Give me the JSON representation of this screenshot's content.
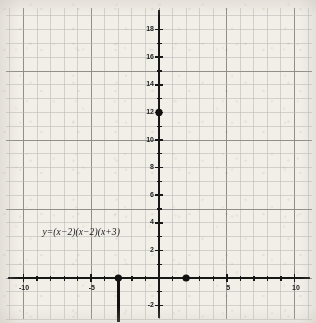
{
  "chart_data": {
    "type": "scatter",
    "title": "",
    "xlabel": "",
    "ylabel": "",
    "xlim": [
      -11.5,
      11.5
    ],
    "ylim": [
      -3.2,
      19.5
    ],
    "grid": true,
    "grid_minor_step": 1,
    "grid_major_step": 5,
    "legend": "none",
    "equation_label": "y=(x−2)(x−2)(x+3)",
    "equation_position": {
      "x": -8.6,
      "y": 3.2
    },
    "x_tick_labels": [
      {
        "value": -10,
        "text": "-10"
      },
      {
        "value": -5,
        "text": "-5"
      },
      {
        "value": 5,
        "text": "5"
      },
      {
        "value": 10,
        "text": "10"
      }
    ],
    "y_tick_labels": [
      {
        "value": 18,
        "text": "18"
      },
      {
        "value": 16,
        "text": "16"
      },
      {
        "value": 14,
        "text": "14"
      },
      {
        "value": 12,
        "text": "12"
      },
      {
        "value": 10,
        "text": "10"
      },
      {
        "value": 8,
        "text": "8"
      },
      {
        "value": 6,
        "text": "6"
      },
      {
        "value": 4,
        "text": "4"
      },
      {
        "value": 2,
        "text": "2"
      },
      {
        "value": -2,
        "text": "-2"
      }
    ],
    "x_minor_ticks": [
      -9,
      -8,
      -7,
      -6,
      -4,
      -3,
      -2,
      -1,
      1,
      2,
      3,
      4,
      6,
      7,
      8,
      9
    ],
    "y_minor_ticks": [
      1,
      3,
      5,
      7,
      9,
      11,
      13,
      15,
      17,
      -1
    ],
    "points": [
      {
        "x": 0,
        "y": 12,
        "label": "y-intercept"
      },
      {
        "x": -3,
        "y": 0,
        "label": "root-x-minus-3"
      },
      {
        "x": 2,
        "y": 0,
        "label": "root-x-2"
      }
    ],
    "segments": [
      {
        "x1": -3,
        "y1": 0,
        "x2": -3,
        "y2": -3.2,
        "label": "vertical-line-at-x-minus-3"
      }
    ],
    "colors": {
      "paper": "#f2efe9",
      "grid_minor": "#b9b8b6",
      "grid_major": "#8b8a88",
      "axis": "#171717",
      "point": "#111111",
      "text": "#1a1a1a"
    }
  }
}
